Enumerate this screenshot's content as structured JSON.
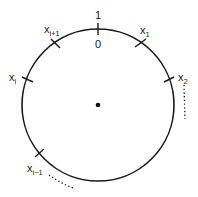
{
  "diagram": {
    "circle": {
      "cx": 98,
      "cy": 105,
      "r": 76,
      "stroke": "#1a1a1a"
    },
    "center_dot": {
      "cx": 98,
      "cy": 105,
      "r": 2.3
    },
    "top_labels": {
      "above": "1",
      "below": "0"
    },
    "points": [
      {
        "id": "x1",
        "base": "x",
        "sub": "1",
        "angle_deg": 56
      },
      {
        "id": "x2",
        "base": "x",
        "sub": "2",
        "angle_deg": 19
      },
      {
        "id": "xi_plus_1",
        "base": "x",
        "sub": "i+1",
        "angle_deg": 124
      },
      {
        "id": "xi",
        "base": "x",
        "sub": "i",
        "angle_deg": 161
      },
      {
        "id": "xi_minus_1",
        "base": "x",
        "sub": "i−1",
        "angle_deg": 219
      }
    ],
    "labels": {
      "x1": {
        "base": "x",
        "sub": "1"
      },
      "x2": {
        "base": "x",
        "sub": "2"
      },
      "xi_plus_1": {
        "base": "x",
        "sub": "i+1"
      },
      "xi": {
        "base": "x",
        "sub": "i"
      },
      "xi_minus_1": {
        "base": "x",
        "sub": "i−1"
      }
    },
    "continuation_marks": [
      {
        "near": "x2",
        "style": "dotted",
        "direction": "clockwise"
      },
      {
        "near": "xi_minus_1",
        "style": "dotted",
        "direction": "clockwise"
      }
    ]
  }
}
